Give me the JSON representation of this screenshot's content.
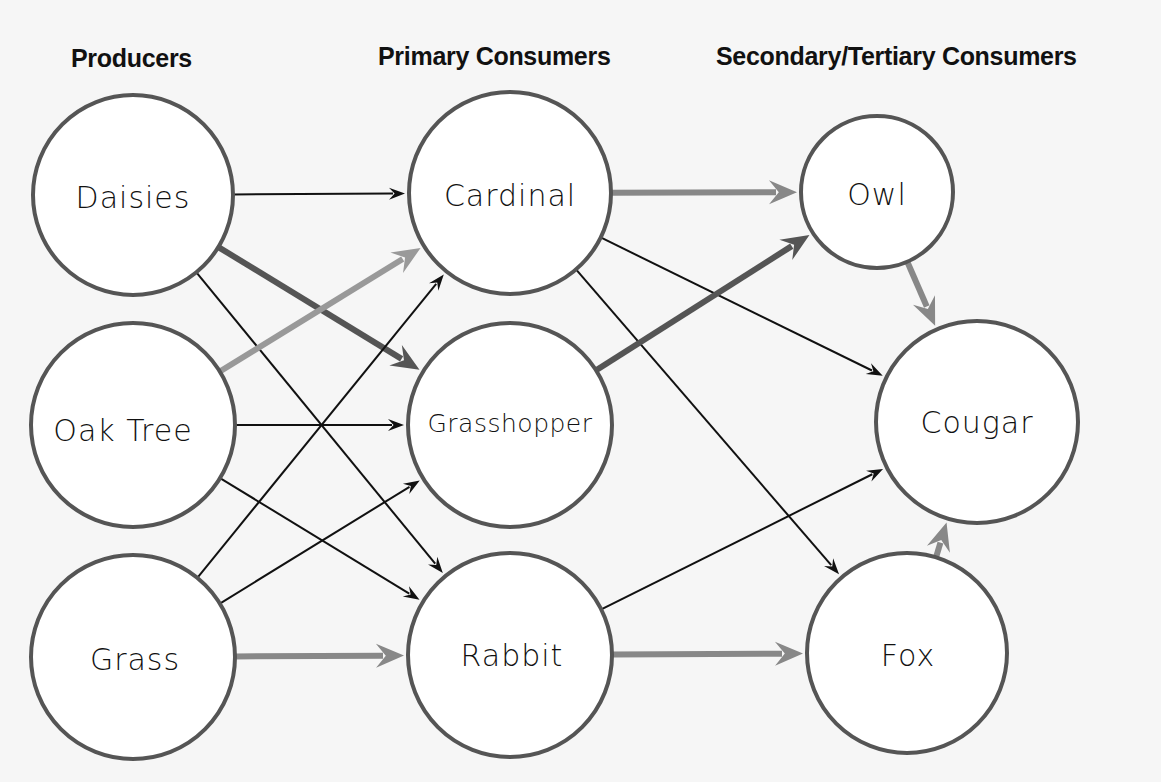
{
  "headings": {
    "producers": "Producers",
    "primary": "Primary Consumers",
    "secondary": "Secondary/Tertiary Consumers"
  },
  "colors": {
    "background": "#f6f6f6",
    "node_fill": "#ffffff",
    "node_stroke": "#555555",
    "thin_arrow": "#111111",
    "dark_arrow": "#555555",
    "mid_arrow": "#888888",
    "light_arrow": "#999999"
  },
  "nodes": [
    {
      "id": "daisies",
      "label": "Daisies",
      "level": "producer",
      "cx": 133,
      "cy": 195,
      "r": 100
    },
    {
      "id": "oak",
      "label": "Oak Tree",
      "level": "producer",
      "cx": 133,
      "cy": 425,
      "r": 102
    },
    {
      "id": "grass",
      "label": "Grass",
      "level": "producer",
      "cx": 133,
      "cy": 657,
      "r": 102
    },
    {
      "id": "cardinal",
      "label": "Cardinal",
      "level": "primary",
      "cx": 510,
      "cy": 193,
      "r": 101
    },
    {
      "id": "grasshopper",
      "label": "Grasshopper",
      "level": "primary",
      "cx": 510,
      "cy": 425,
      "r": 102
    },
    {
      "id": "rabbit",
      "label": "Rabbit",
      "level": "primary",
      "cx": 510,
      "cy": 655,
      "r": 102
    },
    {
      "id": "owl",
      "label": "Owl",
      "level": "secondary",
      "cx": 877,
      "cy": 192,
      "r": 76
    },
    {
      "id": "cougar",
      "label": "Cougar",
      "level": "tertiary",
      "cx": 977,
      "cy": 422,
      "r": 101
    },
    {
      "id": "fox",
      "label": "Fox",
      "level": "secondary",
      "cx": 907,
      "cy": 653,
      "r": 100
    }
  ],
  "edges": [
    {
      "from": "daisies",
      "to": "cardinal",
      "style": "thin"
    },
    {
      "from": "daisies",
      "to": "grasshopper",
      "style": "dark"
    },
    {
      "from": "daisies",
      "to": "rabbit",
      "style": "thin"
    },
    {
      "from": "oak",
      "to": "cardinal",
      "style": "light"
    },
    {
      "from": "oak",
      "to": "grasshopper",
      "style": "thin"
    },
    {
      "from": "oak",
      "to": "rabbit",
      "style": "thin"
    },
    {
      "from": "grass",
      "to": "cardinal",
      "style": "thin"
    },
    {
      "from": "grass",
      "to": "grasshopper",
      "style": "thin"
    },
    {
      "from": "grass",
      "to": "rabbit",
      "style": "mid"
    },
    {
      "from": "cardinal",
      "to": "owl",
      "style": "mid"
    },
    {
      "from": "cardinal",
      "to": "cougar",
      "style": "thin"
    },
    {
      "from": "cardinal",
      "to": "fox",
      "style": "thin"
    },
    {
      "from": "grasshopper",
      "to": "owl",
      "style": "dark"
    },
    {
      "from": "rabbit",
      "to": "cougar",
      "style": "thin"
    },
    {
      "from": "rabbit",
      "to": "fox",
      "style": "mid"
    },
    {
      "from": "owl",
      "to": "cougar",
      "style": "mid"
    },
    {
      "from": "fox",
      "to": "cougar",
      "style": "mid"
    }
  ]
}
